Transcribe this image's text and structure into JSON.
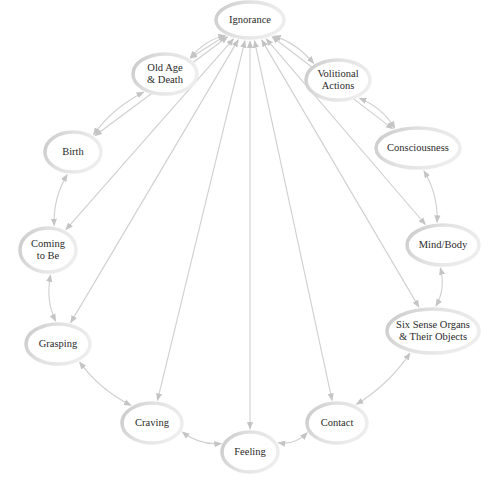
{
  "diagram": {
    "colors": {
      "arrow": "#cfcfcf",
      "ellipse_stroke": "#d4d4d4",
      "text": "#2a2a2a",
      "background": "#ffffff"
    },
    "nodes": [
      {
        "id": "ignorance",
        "lines": [
          "Ignorance"
        ],
        "x": 250,
        "y": 20,
        "rx": 34,
        "ry": 18
      },
      {
        "id": "volitional-actions",
        "lines": [
          "Volitional",
          "Actions"
        ],
        "x": 338,
        "y": 80,
        "rx": 32,
        "ry": 20
      },
      {
        "id": "consciousness",
        "lines": [
          "Consciousness"
        ],
        "x": 418,
        "y": 148,
        "rx": 42,
        "ry": 20
      },
      {
        "id": "mind-body",
        "lines": [
          "Mind/Body"
        ],
        "x": 443,
        "y": 245,
        "rx": 36,
        "ry": 20
      },
      {
        "id": "six-sense-organs",
        "lines": [
          "Six Sense Organs",
          "& Their Objects"
        ],
        "x": 433,
        "y": 331,
        "rx": 46,
        "ry": 22
      },
      {
        "id": "contact",
        "lines": [
          "Contact"
        ],
        "x": 337,
        "y": 423,
        "rx": 30,
        "ry": 20
      },
      {
        "id": "feeling",
        "lines": [
          "Feeling"
        ],
        "x": 250,
        "y": 452,
        "rx": 28,
        "ry": 20
      },
      {
        "id": "craving",
        "lines": [
          "Craving"
        ],
        "x": 152,
        "y": 423,
        "rx": 30,
        "ry": 20
      },
      {
        "id": "grasping",
        "lines": [
          "Grasping"
        ],
        "x": 58,
        "y": 344,
        "rx": 32,
        "ry": 20
      },
      {
        "id": "coming-to-be",
        "lines": [
          "Coming",
          "to Be"
        ],
        "x": 48,
        "y": 250,
        "rx": 28,
        "ry": 22
      },
      {
        "id": "birth",
        "lines": [
          "Birth"
        ],
        "x": 73,
        "y": 152,
        "rx": 28,
        "ry": 20
      },
      {
        "id": "old-age-death",
        "lines": [
          "Old Age",
          "& Death"
        ],
        "x": 165,
        "y": 74,
        "rx": 32,
        "ry": 20
      }
    ],
    "cycle_edges": [
      [
        "ignorance",
        "volitional-actions"
      ],
      [
        "volitional-actions",
        "consciousness"
      ],
      [
        "consciousness",
        "mind-body"
      ],
      [
        "mind-body",
        "six-sense-organs"
      ],
      [
        "six-sense-organs",
        "contact"
      ],
      [
        "contact",
        "feeling"
      ],
      [
        "feeling",
        "craving"
      ],
      [
        "craving",
        "grasping"
      ],
      [
        "grasping",
        "coming-to-be"
      ],
      [
        "coming-to-be",
        "birth"
      ],
      [
        "birth",
        "old-age-death"
      ],
      [
        "old-age-death",
        "ignorance"
      ]
    ],
    "radial_edges_from": "ignorance",
    "radial_edges_to": [
      "consciousness",
      "mind-body",
      "six-sense-organs",
      "contact",
      "feeling",
      "craving",
      "grasping",
      "coming-to-be",
      "birth",
      "old-age-death"
    ]
  }
}
